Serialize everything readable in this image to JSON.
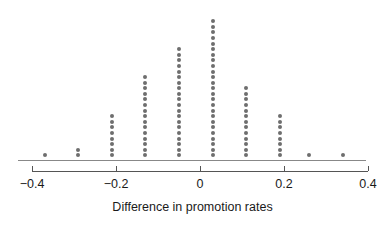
{
  "chart_data": {
    "type": "scatter",
    "plot_style": "dot-plot",
    "title": "",
    "subtitle": "",
    "xlabel": "Difference in promotion rates",
    "ylabel": "",
    "xlim": [
      -0.44,
      0.44
    ],
    "xticks": [
      -0.4,
      -0.2,
      0,
      0.2,
      0.4
    ],
    "xticklabels": [
      "−0.4",
      "−0.2",
      "0",
      "0.2",
      "0.4"
    ],
    "grid": false,
    "legend": null,
    "annotations": [],
    "dot_color": "#6e6e6e",
    "axis_color": "#555555",
    "baseline_color": "#888888",
    "categories": [
      -0.37,
      -0.29,
      -0.21,
      -0.13,
      -0.05,
      0.03,
      0.11,
      0.19,
      0.26,
      0.34
    ],
    "values": [
      1,
      2,
      8,
      15,
      20,
      25,
      13,
      8,
      1,
      1
    ],
    "stacks": [
      {
        "x": -0.37,
        "count": 1
      },
      {
        "x": -0.29,
        "count": 2
      },
      {
        "x": -0.21,
        "count": 8
      },
      {
        "x": -0.13,
        "count": 15
      },
      {
        "x": -0.05,
        "count": 20
      },
      {
        "x": 0.03,
        "count": 25
      },
      {
        "x": 0.11,
        "count": 13
      },
      {
        "x": 0.19,
        "count": 8
      },
      {
        "x": 0.26,
        "count": 1
      },
      {
        "x": 0.34,
        "count": 1
      }
    ],
    "total_points": 94
  },
  "layout": {
    "px_per_unit": 420,
    "x_origin_px": 200,
    "baseline_y_px": 160,
    "axis_rule_y_px": 171,
    "tick_height_px": 5,
    "tick_label_y_px": 177,
    "axis_title_y_px": 200,
    "dot_size_px": 4,
    "dot_pitch_px": 5.6
  }
}
